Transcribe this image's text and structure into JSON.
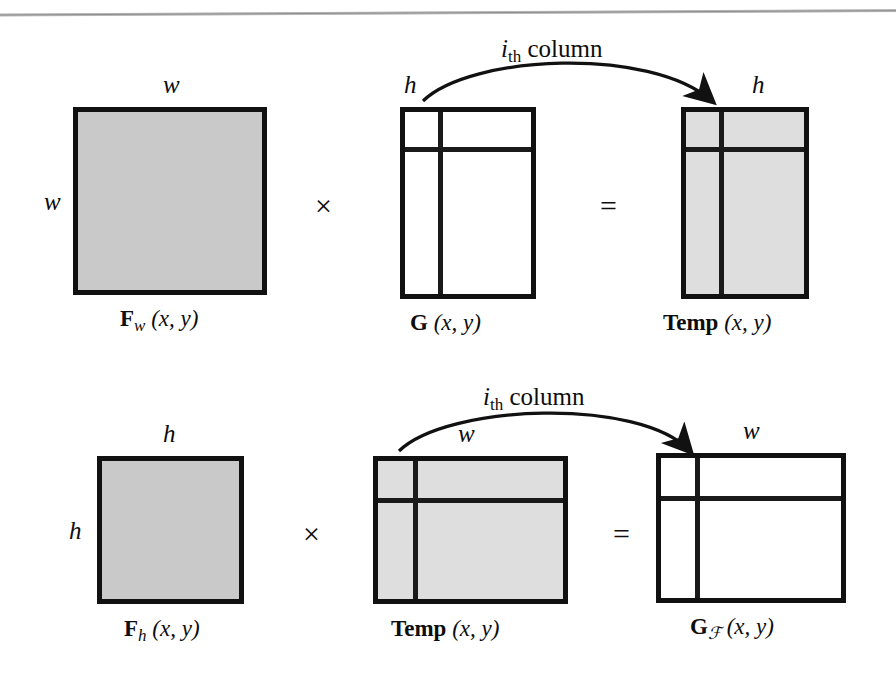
{
  "figure": {
    "rule_color": "#8f8f8f",
    "box_border_color": "#111111",
    "fill_gray": "#c9c9c9",
    "fill_light_gray": "#dedede",
    "operators": {
      "times": "×",
      "equals": "="
    },
    "arrow_label": {
      "base": "i",
      "sub": "th",
      "word": " column"
    },
    "rows": [
      {
        "id": "row-1",
        "operand_a": {
          "name": "F_w",
          "caption_bold": "F",
          "caption_sub": "w",
          "caption_args": " (x, y)",
          "dim_top": "w",
          "dim_left": "w",
          "fill": "gray"
        },
        "operator_1": "×",
        "operand_b": {
          "name": "G",
          "caption_bold": "G",
          "caption_sub": "",
          "caption_args": " (x, y)",
          "dim_top": "h",
          "fill": "white"
        },
        "operator_2": "=",
        "result": {
          "name": "Temp",
          "caption_bold": "Temp",
          "caption_sub": "",
          "caption_args": " (x, y)",
          "dim_top": "h",
          "fill": "light-gray"
        }
      },
      {
        "id": "row-2",
        "operand_a": {
          "name": "F_h",
          "caption_bold": "F",
          "caption_sub": "h",
          "caption_args": " (x, y)",
          "dim_top": "h",
          "dim_left": "h",
          "fill": "gray"
        },
        "operator_1": "×",
        "operand_b": {
          "name": "Temp",
          "caption_bold": "Temp",
          "caption_sub": "",
          "caption_args": " (x, y)",
          "dim_top": "w",
          "fill": "light-gray"
        },
        "operator_2": "=",
        "result": {
          "name": "G_F",
          "caption_bold": "G",
          "caption_sub": "ℱ",
          "caption_args": " (x, y)",
          "dim_top": "w",
          "fill": "white"
        }
      }
    ]
  }
}
